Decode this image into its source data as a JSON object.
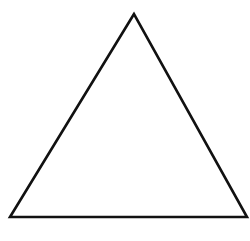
{
  "diagram": {
    "shape": "triangle",
    "fill": "#ffffff",
    "stroke": "#111111",
    "stroke_width": 2.6,
    "vertices": {
      "apex": [
        134,
        14
      ],
      "bottom_left": [
        10,
        217
      ],
      "bottom_right": [
        247,
        217
      ]
    },
    "points": "134,14 10,217 247,217"
  }
}
